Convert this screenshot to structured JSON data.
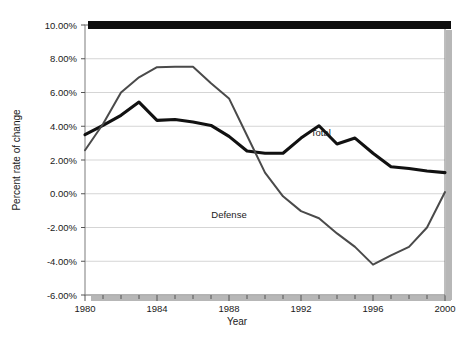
{
  "chart_data": {
    "type": "line",
    "title": "",
    "xlabel": "Year",
    "ylabel": "Percent rate of change",
    "xlim": [
      1980,
      2000
    ],
    "ylim": [
      -0.06,
      0.1
    ],
    "grid": true,
    "legend_position": "inline-annotations",
    "x": [
      1980,
      1981,
      1982,
      1983,
      1984,
      1985,
      1986,
      1987,
      1988,
      1989,
      1990,
      1991,
      1992,
      1993,
      1994,
      1995,
      1996,
      1997,
      1998,
      1999,
      2000
    ],
    "x_tick_labels": [
      "1980",
      "1984",
      "1988",
      "1992",
      "1996",
      "2000"
    ],
    "x_tick_values": [
      1980,
      1984,
      1988,
      1992,
      1996,
      2000
    ],
    "x_minor_ticks_every": 1,
    "y_tick_labels": [
      "10.00%",
      "8.00%",
      "6.00%",
      "4.00%",
      "2.00%",
      "0.00%",
      "-2.00%",
      "-4.00%",
      "-6.00%"
    ],
    "y_tick_values": [
      0.1,
      0.08,
      0.06,
      0.04,
      0.02,
      0.0,
      -0.02,
      -0.04,
      -0.06
    ],
    "series": [
      {
        "name": "Total",
        "label": "Total",
        "color": "#111111",
        "line_width": 3.1,
        "label_x": 1993.1,
        "label_y": 0.0345,
        "values": [
          0.035,
          0.0405,
          0.0465,
          0.0543,
          0.0435,
          0.044,
          0.0425,
          0.0405,
          0.034,
          0.0253,
          0.024,
          0.024,
          0.033,
          0.0403,
          0.0295,
          0.033,
          0.024,
          0.016,
          0.015,
          0.0135,
          0.0125
        ]
      },
      {
        "name": "Defense",
        "label": "Defense",
        "color": "#4a4a4a",
        "line_width": 2.0,
        "label_x": 1988.0,
        "label_y": -0.0142,
        "values": [
          0.0258,
          0.0413,
          0.06,
          0.069,
          0.075,
          0.0752,
          0.0752,
          0.0655,
          0.0565,
          0.0345,
          0.0125,
          -0.0015,
          -0.0103,
          -0.0145,
          -0.0235,
          -0.0315,
          -0.042,
          -0.0365,
          -0.0315,
          -0.02,
          0.001
        ]
      }
    ]
  },
  "plot_geometry": {
    "left": 85,
    "right": 445,
    "top": 25,
    "bottom": 295
  },
  "frame": {
    "top_bar_color": "#0d0d0d",
    "border_color": "#7d7d7d",
    "gridline_color": "#d5d5d5",
    "shadow_color": "#b7b7b7",
    "background": "#ffffff"
  }
}
